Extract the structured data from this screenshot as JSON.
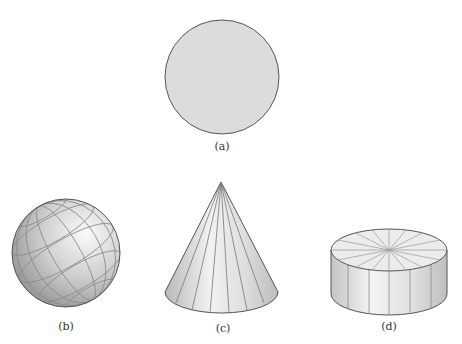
{
  "figure": {
    "panels": [
      {
        "id": "a",
        "label": "(a)",
        "shape": "circle"
      },
      {
        "id": "b",
        "label": "(b)",
        "shape": "sphere"
      },
      {
        "id": "c",
        "label": "(c)",
        "shape": "cone"
      },
      {
        "id": "d",
        "label": "(d)",
        "shape": "cylinder"
      }
    ],
    "colors": {
      "fill": "#dcdcdc",
      "stroke": "#555555",
      "grid": "#8a8a8a",
      "background": "#ffffff"
    }
  }
}
